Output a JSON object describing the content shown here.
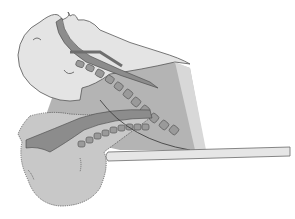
{
  "figure": {
    "colors": {
      "background": "#ffffff",
      "skin_upper": "#e4e4e4",
      "skin_lower": "#c8c8c8",
      "torso_shade": "#b4b4b4",
      "airway": "#8c8c8c",
      "vertebrae": "#9a9a9a",
      "vertebrae_outline": "#5a5a5a",
      "table": "#e6e6e6",
      "table_outline": "#6a6a6a",
      "outline": "#555555"
    }
  }
}
